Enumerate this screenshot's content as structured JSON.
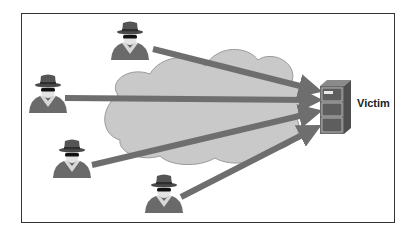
{
  "diagram": {
    "type": "DDoS attack illustration",
    "target_label": "Victim",
    "cloud_label": "",
    "attackers": [
      {
        "id": "attacker-1",
        "x": 130,
        "y": 40
      },
      {
        "id": "attacker-2",
        "x": 48,
        "y": 93
      },
      {
        "id": "attacker-3",
        "x": 72,
        "y": 158
      },
      {
        "id": "attacker-4",
        "x": 164,
        "y": 193
      }
    ],
    "colors": {
      "cloud": "#c9c9c9",
      "cloud_stroke": "#9a9a9a",
      "arrow": "#6e6e6e",
      "attacker": "#6a6a6a",
      "server": "#6a6a6a",
      "frame": "#333333"
    }
  }
}
